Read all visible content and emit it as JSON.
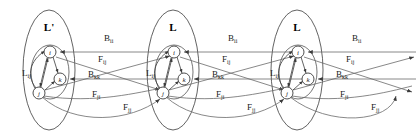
{
  "figure": {
    "type": "layered-graph-diagram",
    "background": "#ffffff",
    "stroke_color": "#3b3b3b",
    "text_color": "#1a1a1a"
  },
  "groups": [
    {
      "id": "g1",
      "label": "L'",
      "cx": 49,
      "cy": 70,
      "rx": 26,
      "ry": 60
    },
    {
      "id": "g2",
      "label": "L",
      "cx": 173,
      "cy": 70,
      "rx": 26,
      "ry": 60
    },
    {
      "id": "g3",
      "label": "L",
      "cx": 297,
      "cy": 70,
      "rx": 26,
      "ry": 60
    }
  ],
  "nodes": [
    {
      "group": "g1",
      "id": "i",
      "label": "i",
      "cx": 50,
      "cy": 52,
      "r": 6
    },
    {
      "group": "g1",
      "id": "k",
      "label": "k",
      "cx": 60,
      "cy": 79,
      "r": 6
    },
    {
      "group": "g1",
      "id": "j",
      "label": "j",
      "cx": 39,
      "cy": 93,
      "r": 6
    },
    {
      "group": "g2",
      "id": "i",
      "label": "i",
      "cx": 174,
      "cy": 52,
      "r": 6
    },
    {
      "group": "g2",
      "id": "k",
      "label": "k",
      "cx": 184,
      "cy": 79,
      "r": 6
    },
    {
      "group": "g2",
      "id": "j",
      "label": "j",
      "cx": 163,
      "cy": 93,
      "r": 6
    },
    {
      "group": "g3",
      "id": "i",
      "label": "i",
      "cx": 298,
      "cy": 52,
      "r": 6
    },
    {
      "group": "g3",
      "id": "k",
      "label": "k",
      "cx": 308,
      "cy": 79,
      "r": 6
    },
    {
      "group": "g3",
      "id": "j",
      "label": "j",
      "cx": 287,
      "cy": 93,
      "r": 6
    }
  ],
  "edge_labels": [
    {
      "id": "Bii-1",
      "base": "B",
      "sub": "ii",
      "x": 104,
      "y": 41
    },
    {
      "id": "Fij-1",
      "base": "F",
      "sub": "ij",
      "x": 98,
      "y": 62
    },
    {
      "id": "Bkk-1",
      "base": "B",
      "sub": "kk",
      "x": 88,
      "y": 77
    },
    {
      "id": "Fji-1",
      "base": "F",
      "sub": "ji",
      "x": 92,
      "y": 97
    },
    {
      "id": "Fjj-1",
      "base": "F",
      "sub": "jj",
      "x": 123,
      "y": 110
    },
    {
      "id": "Lij-1",
      "base": "L",
      "sub": "ij",
      "x": 22,
      "y": 76
    },
    {
      "id": "Bii-2",
      "base": "B",
      "sub": "ii",
      "x": 228,
      "y": 41
    },
    {
      "id": "Fij-2",
      "base": "F",
      "sub": "ij",
      "x": 222,
      "y": 62
    },
    {
      "id": "Bkk-2",
      "base": "B",
      "sub": "kk",
      "x": 212,
      "y": 77
    },
    {
      "id": "Fji-2",
      "base": "F",
      "sub": "ji",
      "x": 216,
      "y": 97
    },
    {
      "id": "Fjj-2",
      "base": "F",
      "sub": "jj",
      "x": 247,
      "y": 110
    },
    {
      "id": "Lij-2",
      "base": "L",
      "sub": "ij",
      "x": 146,
      "y": 76
    },
    {
      "id": "Bii-3",
      "base": "B",
      "sub": "ii",
      "x": 352,
      "y": 41
    },
    {
      "id": "Fij-3",
      "base": "F",
      "sub": "ij",
      "x": 346,
      "y": 62
    },
    {
      "id": "Bkk-3",
      "base": "B",
      "sub": "kk",
      "x": 336,
      "y": 77
    },
    {
      "id": "Fji-3",
      "base": "F",
      "sub": "ji",
      "x": 340,
      "y": 97
    },
    {
      "id": "Fjj-3",
      "base": "F",
      "sub": "jj",
      "x": 371,
      "y": 110
    },
    {
      "id": "Lij-3",
      "base": "L",
      "sub": "ij",
      "x": 270,
      "y": 76
    }
  ],
  "legend_terms": [
    "B_ii",
    "B_kk",
    "F_ij",
    "F_ji",
    "F_jj",
    "L_ij"
  ]
}
